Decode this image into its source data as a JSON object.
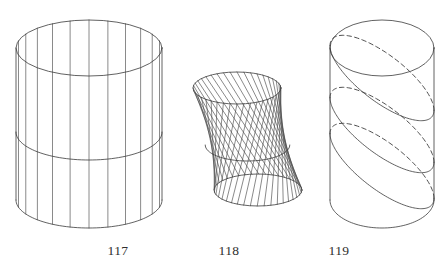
{
  "plate": {
    "background_color": "#ffffff",
    "ink_color": "#3a3a3a",
    "width": 444,
    "height": 275
  },
  "figures": [
    {
      "caption": "117",
      "name": "right-circular-cylinder",
      "description": "Right circular cylinder drawn as a ruled surface with straight vertical generating lines, an upper ellipse rim, a middle horizon ellipse and a lower ellipse rim.",
      "geometry": {
        "type": "cylinder",
        "center_x": 89,
        "top_center_y": 48,
        "bottom_center_y": 200,
        "radius_x": 73,
        "radius_y": 28,
        "ruling_count": 12,
        "rulings_style": "solid-vertical",
        "hidden_lines": "none"
      }
    },
    {
      "caption": "118",
      "name": "twisted-ruled-surface",
      "description": "Hyperboloid-like twisted ruled surface: the lower circle is rotated relative to the upper circle so the straight generators become skew and sweep across.",
      "geometry": {
        "type": "twisted-ruled-surface",
        "top_center_x": 237,
        "top_center_y": 88,
        "top_radius_x": 44,
        "top_radius_y": 16,
        "bottom_center_x": 258,
        "bottom_center_y": 190,
        "bottom_radius_x": 44,
        "bottom_radius_y": 16,
        "twist_degrees": 64,
        "ruling_count": 40,
        "rulings_style": "solid-skew"
      }
    },
    {
      "caption": "119",
      "name": "cylinder-oblique-sections",
      "description": "Vertical circular cylinder cut by three oblique planes; each elliptical section is drawn solid in front and dashed where hidden behind the surface.",
      "geometry": {
        "type": "cylinder-with-oblique-sections",
        "center_x": 382,
        "top_center_y": 48,
        "bottom_center_y": 200,
        "radius_x": 52,
        "radius_y": 28,
        "section_count": 3,
        "section_tilt": "oblique",
        "hidden_lines": "dashed"
      }
    }
  ],
  "captions": {
    "first": "117",
    "second": "118",
    "third": "119"
  }
}
